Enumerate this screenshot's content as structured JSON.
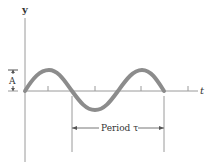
{
  "diagram": {
    "y_axis_label": "y",
    "t_axis_label": "t",
    "amplitude_label": "A",
    "period_label": "Period τ",
    "colors": {
      "axis": "#9a9a9a",
      "wave": "#8c8c8c",
      "text": "#333333",
      "background": "#ffffff"
    }
  }
}
